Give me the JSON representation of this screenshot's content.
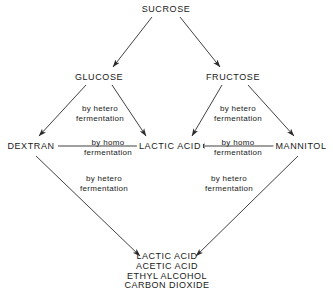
{
  "diagram": {
    "line_color": "#2b2b2b",
    "text_color": "#1a1a1a",
    "background": "#ffffff",
    "nodes": [
      {
        "id": "sucrose",
        "label": "SUCROSE",
        "x": 166,
        "y": 9
      },
      {
        "id": "glucose",
        "label": "GLUCOSE",
        "x": 99,
        "y": 77
      },
      {
        "id": "fructose",
        "label": "FRUCTOSE",
        "x": 233,
        "y": 77
      },
      {
        "id": "dextran",
        "label": "DEXTRAN",
        "x": 31,
        "y": 146
      },
      {
        "id": "lactic-acid",
        "label": "LACTIC ACID",
        "x": 170,
        "y": 146
      },
      {
        "id": "mannitol",
        "label": "MANNITOL",
        "x": 301,
        "y": 146
      }
    ],
    "products": {
      "id": "products",
      "x": 167,
      "y": 252,
      "lines": [
        "LACTIC ACID",
        "ACETIC ACID",
        "ETHYL ALCOHOL",
        "CARBON DIOXIDE"
      ]
    },
    "edge_labels": [
      {
        "id": "glucose-dextran",
        "line1": "by hetero",
        "line2": "fermentation",
        "x": 100,
        "y": 113
      },
      {
        "id": "glucose-lactic",
        "line1": "by homo",
        "line2": "fermentation",
        "x": 108,
        "y": 147
      },
      {
        "id": "fructose-lactic",
        "line1": "by hetero",
        "line2": "fermentation",
        "x": 238,
        "y": 113
      },
      {
        "id": "mannitol-lactic",
        "line1": "by homo",
        "line2": "fermentation",
        "x": 238,
        "y": 147
      },
      {
        "id": "dextran-products",
        "line1": "by hetero",
        "line2": "fermentation",
        "x": 104,
        "y": 183
      },
      {
        "id": "mannitol-products",
        "line1": "by hetero",
        "line2": "fermentation",
        "x": 229,
        "y": 183
      }
    ],
    "edges": [
      {
        "id": "sucrose-to-glucose",
        "from": "sucrose",
        "to": "glucose"
      },
      {
        "id": "sucrose-to-fructose",
        "from": "sucrose",
        "to": "fructose"
      },
      {
        "id": "glucose-to-dextran",
        "from": "glucose",
        "to": "dextran"
      },
      {
        "id": "glucose-to-lactic",
        "from": "glucose",
        "to": "lactic-acid"
      },
      {
        "id": "fructose-to-lactic",
        "from": "fructose",
        "to": "lactic-acid"
      },
      {
        "id": "fructose-to-mannitol",
        "from": "fructose",
        "to": "mannitol"
      },
      {
        "id": "dextran-to-lactic",
        "from": "dextran",
        "to": "lactic-acid"
      },
      {
        "id": "mannitol-to-lactic",
        "from": "mannitol",
        "to": "lactic-acid"
      },
      {
        "id": "dextran-to-products",
        "from": "dextran",
        "to": "products"
      },
      {
        "id": "mannitol-to-products",
        "from": "mannitol",
        "to": "products"
      }
    ]
  }
}
